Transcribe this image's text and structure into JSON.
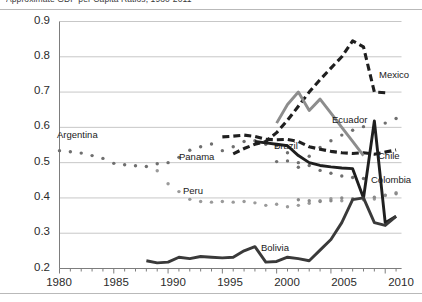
{
  "title": "Approximate GDP per Capita Ratios, 1980-2011",
  "axis": {
    "y_ticks": [
      "0.9",
      "0.8",
      "0.7",
      "0.6",
      "0.5",
      "0.4",
      "0.3",
      "0.2"
    ],
    "x_ticks": [
      "1980",
      "1985",
      "1990",
      "1995",
      "2000",
      "2005",
      "2010"
    ]
  },
  "labels": {
    "argentina": "Argentina",
    "panama": "Panama",
    "brazil": "Brazil",
    "peru": "Peru",
    "bolivia": "Bolivia",
    "mexico": "Mexico",
    "ecuador": "Ecuador",
    "chile": "Chile",
    "colombia": "Colombia"
  },
  "colors": {
    "dark": "#1f1f1f",
    "gray": "#8d8d8d",
    "dot_gray": "#9a9a9a",
    "grid": "#c7c7c7",
    "axis": "#7d7d7d"
  },
  "chart_data": {
    "type": "line",
    "title": "Approximate GDP per Capita Ratios, 1980-2011",
    "xlabel": "",
    "ylabel": "",
    "xlim": [
      1980,
      2011.5
    ],
    "ylim": [
      0.2,
      0.9
    ],
    "grid": true,
    "legend": "inline-annotations",
    "series": [
      {
        "name": "Argentina",
        "style": "dotted",
        "color": "#6f6f6f",
        "x": [
          1980,
          1981,
          1982,
          1983,
          1984,
          1985,
          1986,
          1987,
          1988,
          1989,
          1990,
          1991,
          1992,
          1993,
          1994,
          1995,
          1996,
          1997,
          1998,
          1999,
          2000,
          2001,
          2002,
          2003,
          2004,
          2005,
          2006,
          2007,
          2008,
          2009,
          2010,
          2011
        ],
        "y": [
          0.534,
          0.531,
          0.527,
          0.52,
          0.512,
          0.498,
          0.494,
          0.491,
          0.489,
          0.497,
          0.5,
          0.515,
          0.535,
          0.545,
          0.553,
          0.534,
          0.545,
          0.56,
          0.562,
          0.552,
          0.548,
          0.528,
          0.487,
          0.518,
          0.543,
          0.562,
          0.578,
          0.592,
          0.602,
          0.59,
          0.612,
          0.625
        ]
      },
      {
        "name": "Peru",
        "style": "dotted",
        "color": "#9a9a9a",
        "x": [
          1989,
          1990,
          1991,
          1992,
          1993,
          1994,
          1995,
          1996,
          1997,
          1998,
          1999,
          2000,
          2001,
          2002,
          2003,
          2004,
          2005,
          2006,
          2007,
          2008,
          2009,
          2010,
          2011
        ],
        "y": [
          0.477,
          0.44,
          0.418,
          0.396,
          0.39,
          0.388,
          0.39,
          0.388,
          0.39,
          0.386,
          0.379,
          0.382,
          0.375,
          0.379,
          0.385,
          0.392,
          0.398,
          0.392,
          0.396,
          0.398,
          0.397,
          0.407,
          0.415
        ]
      },
      {
        "name": "Panama",
        "style": "dotted",
        "color": "#6f6f6f",
        "x": [
          2000,
          2001,
          2002,
          2003,
          2004,
          2005,
          2006,
          2007,
          2008
        ],
        "y": [
          0.503,
          0.505,
          0.5,
          0.492,
          0.478,
          0.47,
          0.462,
          0.458,
          0.455
        ]
      },
      {
        "name": "Colombia",
        "style": "dotted",
        "color": "#8a8a8a",
        "x": [
          2002,
          2003,
          2004,
          2005,
          2006,
          2007,
          2008,
          2009,
          2010,
          2011
        ],
        "y": [
          0.395,
          0.392,
          0.39,
          0.392,
          0.4,
          0.398,
          0.395,
          0.402,
          0.408,
          0.412
        ]
      },
      {
        "name": "Brazil",
        "style": "dashed",
        "color": "#1f1f1f",
        "x": [
          1995,
          1996,
          1997,
          1998,
          1999,
          2000,
          2001,
          2002,
          2003,
          2004,
          2005,
          2006,
          2007,
          2008,
          2009,
          2010,
          2011
        ],
        "y": [
          0.573,
          0.575,
          0.578,
          0.574,
          0.566,
          0.565,
          0.566,
          0.56,
          0.545,
          0.538,
          0.532,
          0.528,
          0.526,
          0.528,
          0.524,
          0.53,
          0.536
        ]
      },
      {
        "name": "Mexico",
        "style": "dashed",
        "color": "#1f1f1f",
        "x": [
          1996,
          1997,
          1998,
          1999,
          2000,
          2001,
          2002,
          2003,
          2004,
          2005,
          2006,
          2007,
          2008,
          2009,
          2010
        ],
        "y": [
          0.525,
          0.54,
          0.552,
          0.56,
          0.585,
          0.62,
          0.66,
          0.7,
          0.735,
          0.768,
          0.8,
          0.845,
          0.828,
          0.7,
          0.698
        ]
      },
      {
        "name": "Ecuador",
        "style": "solid",
        "color": "#8d8d8d",
        "x": [
          2000,
          2001,
          2002,
          2003,
          2004,
          2005,
          2006,
          2007,
          2008
        ],
        "y": [
          0.612,
          0.665,
          0.7,
          0.648,
          0.68,
          0.64,
          0.6,
          0.56,
          0.52
        ]
      },
      {
        "name": "Chile",
        "style": "solid",
        "color": "#1f1f1f",
        "x": [
          1998,
          1999,
          2000,
          2001,
          2002,
          2003,
          2004,
          2005,
          2006,
          2007,
          2008,
          2009,
          2010,
          2011
        ],
        "y": [
          0.56,
          0.556,
          0.552,
          0.548,
          0.52,
          0.5,
          0.492,
          0.488,
          0.485,
          0.483,
          0.4,
          0.618,
          0.33,
          0.348
        ]
      },
      {
        "name": "Bolivia",
        "style": "solid",
        "color": "#3a3a3a",
        "x": [
          1988,
          1989,
          1990,
          1991,
          1992,
          1993,
          1994,
          1995,
          1996,
          1997,
          1998,
          1999,
          2000,
          2001,
          2002,
          2003,
          2004,
          2005,
          2006,
          2007,
          2008,
          2009,
          2010,
          2011
        ],
        "y": [
          0.222,
          0.216,
          0.218,
          0.232,
          0.228,
          0.234,
          0.232,
          0.23,
          0.232,
          0.25,
          0.262,
          0.218,
          0.22,
          0.232,
          0.228,
          0.222,
          0.252,
          0.282,
          0.33,
          0.395,
          0.4,
          0.33,
          0.322,
          0.348
        ]
      }
    ]
  }
}
